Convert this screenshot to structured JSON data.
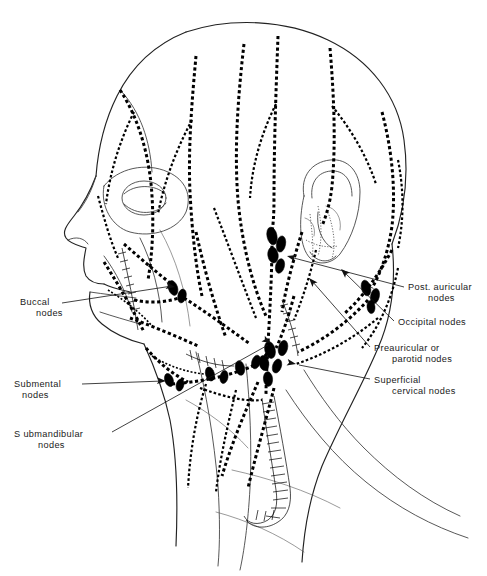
{
  "figure": {
    "view": "left lateral view of head and neck",
    "background_color": "#ffffff",
    "ink_color": "#000000",
    "node_fill_color": "#000000"
  },
  "labels": [
    {
      "id": "buccal",
      "text_lines": [
        "Buccal",
        "nodes"
      ],
      "text_x": 20,
      "text_y": 305,
      "align": "start",
      "indent_second": 16,
      "leader": "M 62,303 L 172,286",
      "arrow": true,
      "arrow_at": [
        175,
        287
      ],
      "arrow_angle": 189
    },
    {
      "id": "submental",
      "text_lines": [
        "Submental",
        "nodes"
      ],
      "text_x": 14,
      "text_y": 387,
      "align": "start",
      "indent_second": 8,
      "leader": "M 82,384 L 163,381",
      "arrow": true,
      "arrow_at": [
        166,
        381
      ],
      "arrow_angle": 182
    },
    {
      "id": "submandibular",
      "text_lines": [
        "S ubmandibular",
        "nodes"
      ],
      "text_x": 14,
      "text_y": 437,
      "align": "start",
      "indent_second": 24,
      "leader": "M 112,432 L 268,345",
      "arrow": true,
      "arrow_at": [
        271,
        343
      ],
      "arrow_angle": 209
    },
    {
      "id": "post-auricular",
      "text_lines": [
        "Post. auricular",
        "nodes"
      ],
      "text_x": 408,
      "text_y": 290,
      "align": "start",
      "indent_second": 20,
      "leader": "M 404,287 L 290,257",
      "arrow": true,
      "arrow_at": [
        287,
        256
      ],
      "arrow_angle": 15
    },
    {
      "id": "occipital",
      "text_lines": [
        "Occipital nodes"
      ],
      "text_x": 398,
      "text_y": 325,
      "align": "start",
      "indent_second": 0,
      "leader": "M 394,321 L 344,272",
      "arrow": true,
      "arrow_at": [
        341,
        269
      ],
      "arrow_angle": 44
    },
    {
      "id": "preauricular",
      "text_lines": [
        "Preauricular  or",
        "parotid nodes"
      ],
      "text_x": 374,
      "text_y": 351,
      "align": "start",
      "indent_second": 18,
      "leader": "M 370,347 L 312,281",
      "arrow": true,
      "arrow_at": [
        309,
        278
      ],
      "arrow_angle": 48
    },
    {
      "id": "superficial-cervical",
      "text_lines": [
        "Superficial",
        "cervical nodes"
      ],
      "text_x": 374,
      "text_y": 383,
      "align": "start",
      "indent_second": 18,
      "leader": "M 370,379 L 299,365",
      "arrow": true,
      "arrow_at": [
        296,
        364
      ],
      "arrow_angle": 191
    }
  ],
  "node_groups": [
    {
      "name": "deep-cervical-upper",
      "nodes": [
        {
          "cx": 272,
          "cy": 236,
          "rx": 5.0,
          "ry": 9.0,
          "rot": -12
        },
        {
          "cx": 281,
          "cy": 244,
          "rx": 4.6,
          "ry": 8.2,
          "rot": 10
        },
        {
          "cx": 273,
          "cy": 255,
          "rx": 5.2,
          "ry": 8.0,
          "rot": -8
        },
        {
          "cx": 280,
          "cy": 266,
          "rx": 4.4,
          "ry": 7.4,
          "rot": 14
        }
      ]
    },
    {
      "name": "buccal",
      "nodes": [
        {
          "cx": 173,
          "cy": 288,
          "rx": 4.6,
          "ry": 7.6,
          "rot": -18
        },
        {
          "cx": 182,
          "cy": 296,
          "rx": 4.2,
          "ry": 7.0,
          "rot": 12
        }
      ]
    },
    {
      "name": "post-auricular",
      "nodes": [
        {
          "cx": 366,
          "cy": 288,
          "rx": 4.6,
          "ry": 8.0,
          "rot": -14
        },
        {
          "cx": 375,
          "cy": 296,
          "rx": 4.4,
          "ry": 7.6,
          "rot": 12
        },
        {
          "cx": 371,
          "cy": 307,
          "rx": 4.0,
          "ry": 6.6,
          "rot": -6
        }
      ]
    },
    {
      "name": "submandibular",
      "nodes": [
        {
          "cx": 210,
          "cy": 374,
          "rx": 4.4,
          "ry": 7.2,
          "rot": -16
        },
        {
          "cx": 224,
          "cy": 377,
          "rx": 4.0,
          "ry": 6.6,
          "rot": 10
        },
        {
          "cx": 240,
          "cy": 368,
          "rx": 4.6,
          "ry": 7.4,
          "rot": -12
        },
        {
          "cx": 256,
          "cy": 362,
          "rx": 4.2,
          "ry": 7.0,
          "rot": 16
        }
      ]
    },
    {
      "name": "submental",
      "nodes": [
        {
          "cx": 169,
          "cy": 380,
          "rx": 4.2,
          "ry": 6.8,
          "rot": -20
        },
        {
          "cx": 180,
          "cy": 385,
          "rx": 3.8,
          "ry": 6.2,
          "rot": 14
        }
      ]
    },
    {
      "name": "superficial-cervical",
      "nodes": [
        {
          "cx": 270,
          "cy": 350,
          "rx": 5.2,
          "ry": 8.6,
          "rot": -14
        },
        {
          "cx": 283,
          "cy": 348,
          "rx": 4.6,
          "ry": 7.8,
          "rot": 14
        },
        {
          "cx": 264,
          "cy": 363,
          "rx": 4.8,
          "ry": 7.6,
          "rot": -10
        },
        {
          "cx": 277,
          "cy": 366,
          "rx": 4.4,
          "ry": 7.2,
          "rot": 18
        },
        {
          "cx": 268,
          "cy": 379,
          "rx": 4.6,
          "ry": 7.4,
          "rot": -6
        }
      ]
    }
  ]
}
